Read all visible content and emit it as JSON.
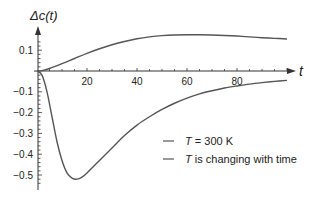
{
  "chart_data": {
    "type": "line",
    "title": "",
    "xlabel": "t",
    "ylabel": "Δc(t)",
    "xlim": [
      0,
      100
    ],
    "ylim": [
      -0.56,
      0.18
    ],
    "x_ticks": [
      20,
      40,
      60,
      80
    ],
    "x_tick_labels": [
      "20",
      "40",
      "60",
      "80"
    ],
    "y_ticks": [
      0.1,
      -0.1,
      -0.2,
      -0.3,
      -0.4,
      -0.5
    ],
    "y_tick_labels": [
      "0.1",
      "−0.1",
      "−0.2",
      "−0.3",
      "−0.4",
      "−0.5"
    ],
    "grid": false,
    "legend_position": "bottom-right",
    "series": [
      {
        "name": "T = 300 K",
        "legend_italic": "T",
        "legend_rest": " = 300 K",
        "color": "#555555",
        "x": [
          0,
          2,
          5,
          10,
          15,
          20,
          25,
          30,
          35,
          40,
          45,
          50,
          55,
          60,
          65,
          70,
          75,
          80,
          85,
          90,
          95,
          100
        ],
        "y": [
          0,
          0.002,
          0.012,
          0.035,
          0.06,
          0.085,
          0.107,
          0.126,
          0.142,
          0.155,
          0.164,
          0.17,
          0.173,
          0.174,
          0.174,
          0.173,
          0.171,
          0.168,
          0.164,
          0.16,
          0.157,
          0.154
        ]
      },
      {
        "name": "T is changing with time",
        "legend_italic": "T",
        "legend_rest": " is changing with time",
        "color": "#555555",
        "x": [
          0,
          2,
          4,
          6,
          8,
          10,
          12,
          14,
          16,
          18,
          20,
          25,
          30,
          35,
          40,
          45,
          50,
          55,
          60,
          65,
          70,
          75,
          80,
          85,
          90,
          95,
          100
        ],
        "y": [
          0,
          -0.02,
          -0.1,
          -0.22,
          -0.34,
          -0.43,
          -0.49,
          -0.515,
          -0.52,
          -0.51,
          -0.49,
          -0.43,
          -0.37,
          -0.31,
          -0.26,
          -0.22,
          -0.185,
          -0.155,
          -0.13,
          -0.11,
          -0.095,
          -0.082,
          -0.072,
          -0.063,
          -0.056,
          -0.05,
          -0.045
        ]
      }
    ]
  }
}
